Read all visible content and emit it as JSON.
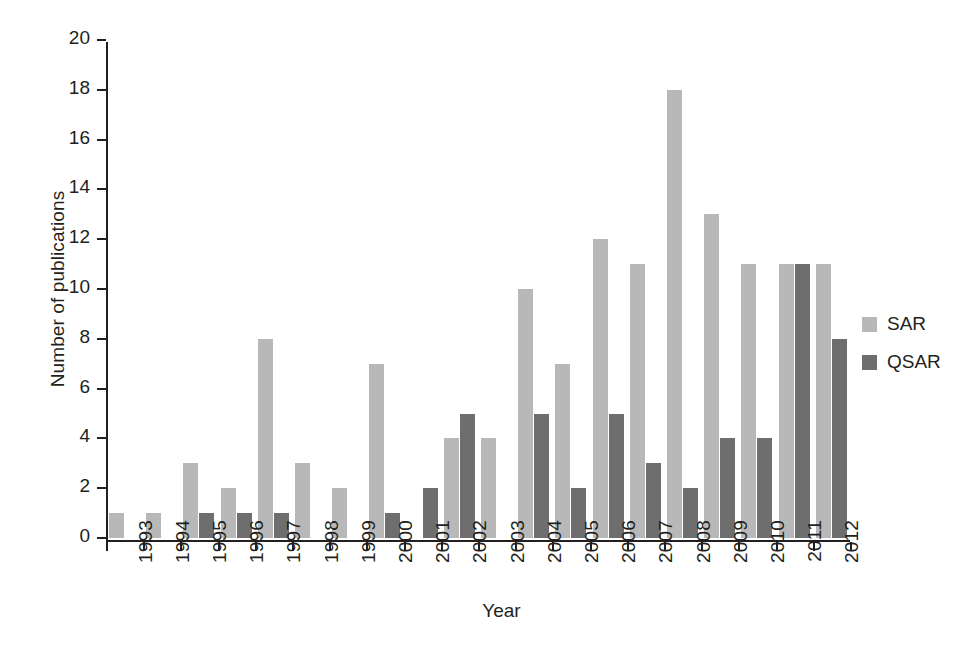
{
  "chart_data": {
    "type": "bar",
    "title": "",
    "subtitle": "",
    "xlabel": "Year",
    "ylabel": "Number of publications",
    "categories": [
      "1993",
      "1994",
      "1995",
      "1996",
      "1997",
      "1998",
      "1999",
      "2000",
      "2001",
      "2002",
      "2003",
      "2004",
      "2005",
      "2006",
      "2007",
      "2008",
      "2009",
      "2010",
      "2011",
      "2012"
    ],
    "series": [
      {
        "name": "SAR",
        "color": "#b8b8b8",
        "values": [
          1,
          1,
          3,
          2,
          8,
          3,
          2,
          7,
          0,
          4,
          4,
          10,
          7,
          12,
          11,
          18,
          13,
          11,
          11,
          11
        ]
      },
      {
        "name": "QSAR",
        "color": "#6e6e6e",
        "values": [
          0,
          0,
          1,
          1,
          1,
          0,
          0,
          1,
          2,
          5,
          0,
          5,
          2,
          5,
          3,
          2,
          4,
          4,
          11,
          8
        ]
      }
    ],
    "ylim": [
      0,
      20
    ],
    "yticks": [
      0,
      2,
      4,
      6,
      8,
      10,
      12,
      14,
      16,
      18,
      20
    ],
    "ytick_labels": [
      "0",
      "2",
      "4",
      "6",
      "8",
      "10",
      "12",
      "14",
      "16",
      "18",
      "20"
    ],
    "grid": false,
    "legend_position": "right",
    "axis_color": "#231f20",
    "background": "#ffffff"
  },
  "legend": {
    "entries": [
      {
        "label": "SAR",
        "color": "#b8b8b8"
      },
      {
        "label": "QSAR",
        "color": "#6e6e6e"
      }
    ]
  }
}
